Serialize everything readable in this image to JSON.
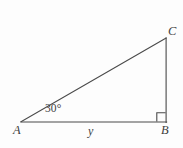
{
  "figure": {
    "type": "right-triangle-diagram",
    "background_color": "#fdfdfd",
    "stroke_color": "#4a4a4a",
    "stroke_width": 1.1,
    "canvas": {
      "width": 183,
      "height": 148
    },
    "vertices": {
      "A": {
        "label": "A",
        "x": 21,
        "y": 122
      },
      "B": {
        "label": "B",
        "x": 166,
        "y": 122
      },
      "C": {
        "label": "C",
        "x": 166,
        "y": 38
      }
    },
    "edges": [
      {
        "name": "base-AB",
        "from": "A",
        "to": "B"
      },
      {
        "name": "vertical-BC",
        "from": "B",
        "to": "C"
      },
      {
        "name": "hypotenuse-AC",
        "from": "A",
        "to": "C"
      }
    ],
    "angle_marks": [
      {
        "name": "angle-at-A",
        "at": "A",
        "label": "30°",
        "kind": "text"
      },
      {
        "name": "right-angle-at-B",
        "at": "B",
        "label": "",
        "kind": "square",
        "size": 9
      }
    ],
    "side_labels": [
      {
        "name": "base-length",
        "label": "y",
        "edge": "base-AB"
      }
    ]
  }
}
